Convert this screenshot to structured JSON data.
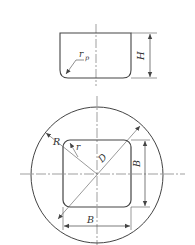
{
  "diagram": {
    "type": "technical-drawing",
    "side_view": {
      "labels": {
        "corner_radius": "r",
        "corner_radius_sub": "p",
        "height": "H"
      }
    },
    "plan_view": {
      "labels": {
        "blank_radius": "R",
        "corner_radius": "r",
        "diagonal": "D",
        "side_vertical": "B",
        "side_horizontal": "B"
      }
    },
    "colors": {
      "line": "#444444",
      "centerline": "#777777",
      "background": "#ffffff"
    }
  }
}
